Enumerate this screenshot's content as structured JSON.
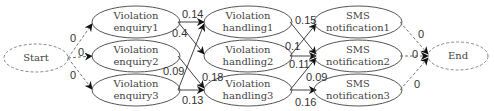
{
  "nodes": {
    "start": {
      "label": "Start"
    },
    "end": {
      "label": "End"
    },
    "enquiry1": {
      "line1": "Violation",
      "line2": "enquiry1"
    },
    "enquiry2": {
      "line1": "Violation",
      "line2": "enquiry2"
    },
    "enquiry3": {
      "line1": "Violation",
      "line2": "enquiry3"
    },
    "handling1": {
      "line1": "Violation",
      "line2": "handling1"
    },
    "handling2": {
      "line1": "Violation",
      "line2": "handling2"
    },
    "handling3": {
      "line1": "Violation",
      "line2": "handling3"
    },
    "sms1": {
      "line1": "SMS",
      "line2": "notification1"
    },
    "sms2": {
      "line1": "SMS",
      "line2": "notification2"
    },
    "sms3": {
      "line1": "SMS",
      "line2": "notification3"
    }
  },
  "edges": {
    "start_enq1": "0",
    "start_enq2": "0",
    "start_enq3": "0",
    "enq1_hand1": "0.14",
    "enq1_hand2": "0.4",
    "enq2_hand3": "0.18",
    "enq3_hand1": "0.09",
    "enq3_hand3": "0.13",
    "hand1_sms2": "0.15",
    "hand2_sms1": "0.1",
    "hand2_sms2": "0.11",
    "hand3_sms2": "0.09",
    "hand3_sms3": "0.16",
    "sms1_end": "0",
    "sms2_end": "0",
    "sms3_end": "0"
  }
}
